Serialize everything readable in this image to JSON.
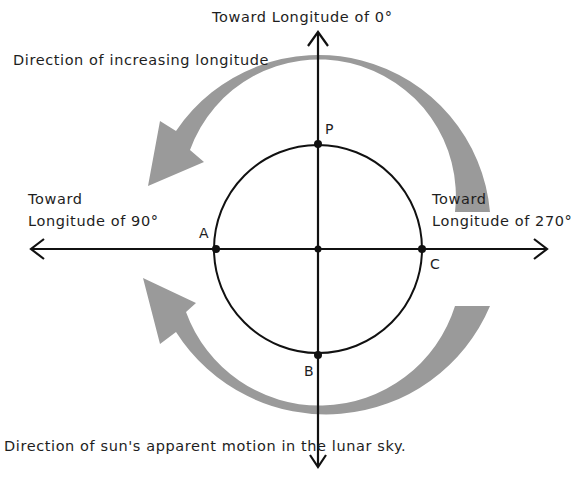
{
  "diagram": {
    "title_top": "Toward Longitude  of 0°",
    "increasing_label": "Direction of increasing longitude",
    "left_label_line1": "Toward",
    "left_label_line2": "Longitude of  90°",
    "right_label_line1": "Toward",
    "right_label_line2": "Longitude of 270°",
    "bottom_label": "Direction of sun's apparent motion in the lunar sky.",
    "points": {
      "P": "P",
      "A": "A",
      "B": "B",
      "C": "C"
    },
    "colors": {
      "line": "#111111",
      "arrow_fill": "#9a9a9a",
      "background": "#ffffff"
    }
  }
}
